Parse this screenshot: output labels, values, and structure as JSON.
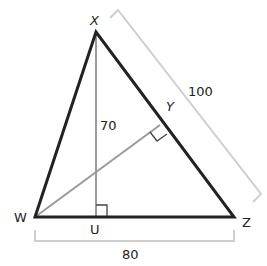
{
  "diagram": {
    "type": "triangle-geometry",
    "vertices": {
      "X": {
        "label": "X",
        "x": 96,
        "y": 32
      },
      "W": {
        "label": "W",
        "x": 35,
        "y": 217
      },
      "Z": {
        "label": "Z",
        "x": 234,
        "y": 217
      },
      "U": {
        "label": "U",
        "x": 96,
        "y": 217
      },
      "Y": {
        "label": "Y",
        "x": 160,
        "y": 125
      }
    },
    "segments": {
      "altitude_XU": {
        "from": "X",
        "to": "U",
        "label": "70",
        "right_angle_at": "U"
      },
      "altitude_WY": {
        "from": "W",
        "to": "Y",
        "right_angle_at": "Y"
      },
      "side_XZ": {
        "label": "100"
      },
      "side_WZ": {
        "label": "80"
      }
    },
    "colors": {
      "triangle": "#222222",
      "altitude": "#999999",
      "bracket": "#cccccc",
      "text": "#222222"
    }
  },
  "labels": {
    "X": "X",
    "Y": "Y",
    "W": "W",
    "Z": "Z",
    "U": "U",
    "len_XU": "70",
    "len_XZ": "100",
    "len_WZ": "80"
  }
}
